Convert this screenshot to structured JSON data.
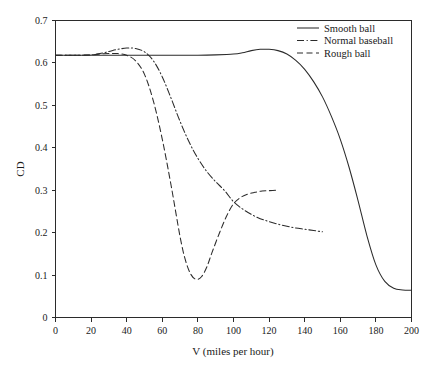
{
  "chart_data": {
    "type": "line",
    "title": "",
    "xlabel": "V (miles per hour)",
    "ylabel": "CD",
    "xlim": [
      0,
      200
    ],
    "ylim": [
      0,
      0.7
    ],
    "grid": false,
    "legend_position": "top-right",
    "xticks": [
      0,
      20,
      40,
      60,
      80,
      100,
      120,
      140,
      160,
      180,
      200
    ],
    "xtick_labels": [
      "0",
      "20",
      "40",
      "60",
      "80",
      "100",
      "120",
      "140",
      "160",
      "180",
      "200"
    ],
    "yticks": [
      0,
      0.1,
      0.2,
      0.3,
      0.4,
      0.5,
      0.6,
      0.7
    ],
    "ytick_labels": [
      "0",
      "0.1",
      "0.2",
      "0.3",
      "0.4",
      "0.5",
      "0.6",
      "0.7"
    ],
    "series": [
      {
        "name": "Smooth ball",
        "style": "solid",
        "color": "#2b2b2b",
        "x": [
          0,
          10,
          20,
          30,
          40,
          50,
          60,
          70,
          80,
          90,
          100,
          105,
          110,
          115,
          120,
          125,
          130,
          135,
          140,
          145,
          150,
          155,
          160,
          165,
          170,
          175,
          180,
          185,
          190,
          195,
          200
        ],
        "y": [
          0.618,
          0.618,
          0.618,
          0.618,
          0.618,
          0.618,
          0.618,
          0.618,
          0.618,
          0.619,
          0.621,
          0.624,
          0.629,
          0.632,
          0.632,
          0.629,
          0.621,
          0.606,
          0.585,
          0.556,
          0.52,
          0.474,
          0.42,
          0.353,
          0.275,
          0.192,
          0.124,
          0.085,
          0.069,
          0.065,
          0.064
        ]
      },
      {
        "name": "Normal baseball",
        "style": "dash-dot",
        "color": "#2b2b2b",
        "x": [
          0,
          10,
          20,
          25,
          30,
          35,
          40,
          45,
          50,
          55,
          60,
          65,
          70,
          75,
          80,
          85,
          90,
          95,
          100,
          105,
          110,
          115,
          120,
          125,
          130,
          135,
          140,
          145,
          150
        ],
        "y": [
          0.618,
          0.618,
          0.619,
          0.622,
          0.627,
          0.632,
          0.635,
          0.634,
          0.626,
          0.605,
          0.567,
          0.516,
          0.462,
          0.414,
          0.375,
          0.344,
          0.32,
          0.299,
          0.273,
          0.256,
          0.243,
          0.233,
          0.226,
          0.22,
          0.215,
          0.211,
          0.208,
          0.205,
          0.202
        ]
      },
      {
        "name": "Rough ball",
        "style": "dashed",
        "color": "#2b2b2b",
        "x": [
          0,
          10,
          20,
          25,
          30,
          35,
          40,
          45,
          50,
          55,
          60,
          65,
          70,
          73,
          76,
          79,
          82,
          85,
          88,
          92,
          96,
          100,
          104,
          108,
          112,
          116,
          120,
          125
        ],
        "y": [
          0.618,
          0.618,
          0.619,
          0.621,
          0.622,
          0.622,
          0.618,
          0.605,
          0.573,
          0.51,
          0.42,
          0.31,
          0.19,
          0.135,
          0.102,
          0.09,
          0.096,
          0.119,
          0.154,
          0.198,
          0.238,
          0.268,
          0.283,
          0.291,
          0.295,
          0.298,
          0.299,
          0.3
        ]
      }
    ]
  },
  "legend": {
    "entries": [
      {
        "label": "Smooth ball",
        "style": "solid"
      },
      {
        "label": "Normal baseball",
        "style": "dash-dot"
      },
      {
        "label": "Rough ball",
        "style": "dashed"
      }
    ]
  },
  "colors": {
    "ink": "#2b2b2b",
    "background": "#ffffff"
  }
}
